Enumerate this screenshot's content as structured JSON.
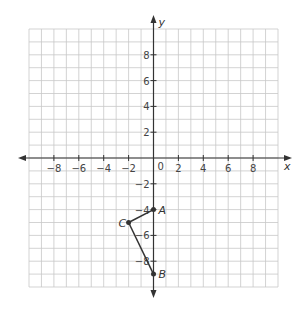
{
  "chart_data": {
    "type": "coordinate-grid",
    "xlabel": "x",
    "ylabel": "y",
    "xlim": [
      -10,
      10
    ],
    "ylim": [
      -10,
      10
    ],
    "grid": true,
    "x_ticks": [
      -8,
      -6,
      -4,
      -2,
      2,
      4,
      6,
      8
    ],
    "y_ticks": [
      8,
      6,
      4,
      2,
      -2,
      -4,
      -6,
      -8
    ],
    "origin_label": "0",
    "points": [
      {
        "name": "A",
        "x": 0,
        "y": -4
      },
      {
        "name": "B",
        "x": 0,
        "y": -9
      },
      {
        "name": "C",
        "x": -2,
        "y": -5
      }
    ],
    "segments": [
      [
        "A",
        "C"
      ],
      [
        "C",
        "B"
      ]
    ]
  },
  "colors": {
    "grid": "#c8c8c8",
    "axis": "#333333",
    "segment": "#333333"
  }
}
